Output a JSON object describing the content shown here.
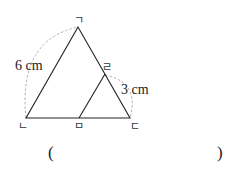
{
  "diagram": {
    "vertices": {
      "top": {
        "label": "ㄱ"
      },
      "bottom_left": {
        "label": "ㄴ"
      },
      "bottom_right": {
        "label": "ㄷ"
      },
      "right_mid": {
        "label": "ㄹ"
      },
      "bottom_mid": {
        "label": "ㅁ"
      }
    },
    "measurements": {
      "left_side": "6 cm",
      "small_side": "3 cm"
    },
    "answer": {
      "open": "(",
      "close": ")"
    }
  }
}
